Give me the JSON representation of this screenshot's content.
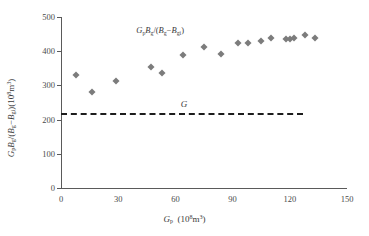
{
  "chart_data": {
    "type": "scatter",
    "title": "",
    "xlabel": "Gp (10^8 m^3)",
    "ylabel": "GpBg/(Bg-Bgi) (10^8 m^3)",
    "xlim": [
      0,
      150
    ],
    "ylim": [
      0,
      500
    ],
    "xticks": [
      0,
      30,
      60,
      90,
      120,
      150
    ],
    "yticks": [
      0,
      100,
      200,
      300,
      400,
      500
    ],
    "grid": false,
    "legend": "none",
    "series": [
      {
        "name": "GpBg/(Bg-Bgi)",
        "marker": "diamond",
        "color": "#7c7c7c",
        "x": [
          8,
          16,
          29,
          47,
          53,
          64,
          75,
          84,
          93,
          98,
          105,
          110,
          118,
          120,
          122,
          128,
          133
        ],
        "values": [
          330,
          282,
          314,
          353,
          337,
          389,
          412,
          393,
          423,
          424,
          431,
          438,
          436,
          437,
          439,
          448,
          439
        ]
      }
    ],
    "reference_lines": [
      {
        "name": "G",
        "label": "G",
        "orientation": "horizontal",
        "value": 220,
        "x_start": 0,
        "x_end": 127,
        "style": "dashed",
        "color": "#1d1d1d"
      }
    ],
    "annotations": [
      {
        "name": "series-annotation",
        "text": "GpBg/(Bg-Bgi)",
        "x": 52,
        "y": 455
      }
    ]
  },
  "axes": {
    "x_tick_labels": [
      "0",
      "30",
      "60",
      "90",
      "120",
      "150"
    ],
    "y_tick_labels": [
      "0",
      "100",
      "200",
      "300",
      "400",
      "500"
    ],
    "x_title": {
      "var": "G",
      "var_sub": "p",
      "units_open": "(10",
      "units_exp": "8",
      "units_close": "m",
      "units_exp2": "3",
      "units_tail": ")"
    },
    "y_title": {
      "v1": "G",
      "v1_sub": "p",
      "v2": "B",
      "v2_sub": "g",
      "slash": "/(",
      "v3": "B",
      "v3_sub": "g",
      "minus": "−",
      "v4": "B",
      "v4_sub": "gi",
      "close": ")",
      "units_open": "(10",
      "units_exp": "8",
      "units_mid": "m",
      "units_exp2": "3",
      "units_close": ")"
    }
  },
  "annotation_text": {
    "v1": "G",
    "v1_sub": "p",
    "v2": "B",
    "v2_sub": "g",
    "slash": "/(",
    "v3": "B",
    "v3_sub": "g",
    "minus": "−",
    "v4": "B",
    "v4_sub": "gi",
    "close": ")"
  },
  "g_label": "G",
  "colors": {
    "marker": "#7c7c7c",
    "axis": "#5a5a5a",
    "reference_line": "#1d1d1d",
    "background": "#ffffff"
  }
}
